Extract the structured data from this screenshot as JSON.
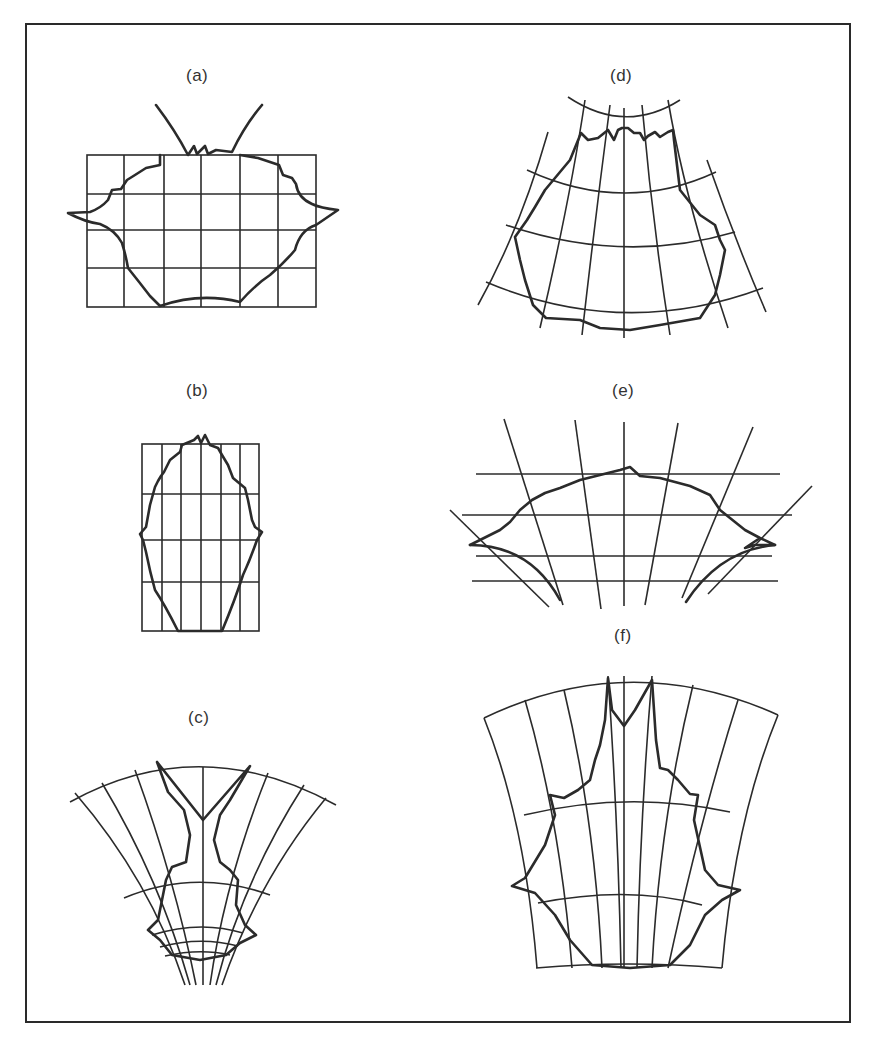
{
  "figure": {
    "panels": [
      {
        "id": "a",
        "label": "(a)",
        "description": "Rectangular grid with outline shape, two horns rising from top, side spikes"
      },
      {
        "id": "b",
        "label": "(b)",
        "description": "Tall narrow rectangular grid with elongated outline"
      },
      {
        "id": "c",
        "label": "(c)",
        "description": "Fan-shaped converging grid with forked outline"
      },
      {
        "id": "d",
        "label": "(d)",
        "description": "Curved fan grid (widening downward) with rounded outline"
      },
      {
        "id": "e",
        "label": "(e)",
        "description": "Horizontal lines with diverging radial lines and arched wavy outline"
      },
      {
        "id": "f",
        "label": "(f)",
        "description": "Curved trapezoidal grid with forked-top outline and side spikes"
      }
    ],
    "colors": {
      "ink": "#2b2b2b",
      "background": "#ffffff"
    }
  }
}
